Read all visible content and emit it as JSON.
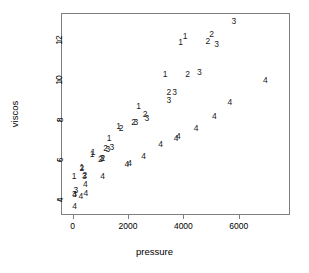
{
  "chart_data": {
    "type": "scatter",
    "title": "",
    "xlabel": "pressure",
    "ylabel": "viscos",
    "grid": false,
    "legend": "none",
    "point_style": "group-number-glyph",
    "xlim": [
      -420,
      7850
    ],
    "ylim": [
      3.25,
      13.35
    ],
    "xticks": [
      0,
      2000,
      4000,
      6000
    ],
    "yticks": [
      4,
      6,
      8,
      10,
      12
    ],
    "xtick_labels": [
      "0",
      "2000",
      "4000",
      "6000"
    ],
    "ytick_labels": [
      "4",
      "6",
      "8",
      "10",
      "12"
    ],
    "groups": [
      "1",
      "2",
      "3",
      "4"
    ],
    "points": [
      {
        "label": "1",
        "x": 55,
        "y": 5.22
      },
      {
        "label": "1",
        "x": 330,
        "y": 5.67
      },
      {
        "label": "1",
        "x": 700,
        "y": 6.32
      },
      {
        "label": "1",
        "x": 740,
        "y": 6.38
      },
      {
        "label": "1",
        "x": 1320,
        "y": 7.1
      },
      {
        "label": "1",
        "x": 1660,
        "y": 7.72
      },
      {
        "label": "1",
        "x": 2380,
        "y": 8.72
      },
      {
        "label": "1",
        "x": 3340,
        "y": 10.28
      },
      {
        "label": "1",
        "x": 3900,
        "y": 11.88
      },
      {
        "label": "1",
        "x": 4060,
        "y": 12.22
      },
      {
        "label": "2",
        "x": 330,
        "y": 5.62
      },
      {
        "label": "2",
        "x": 440,
        "y": 5.26
      },
      {
        "label": "2",
        "x": 1000,
        "y": 6.06
      },
      {
        "label": "2",
        "x": 1090,
        "y": 6.12
      },
      {
        "label": "2",
        "x": 1190,
        "y": 6.58
      },
      {
        "label": "2",
        "x": 1750,
        "y": 7.62
      },
      {
        "label": "2",
        "x": 2200,
        "y": 7.92
      },
      {
        "label": "2",
        "x": 2620,
        "y": 8.28
      },
      {
        "label": "2",
        "x": 3480,
        "y": 9.4
      },
      {
        "label": "2",
        "x": 4150,
        "y": 10.28
      },
      {
        "label": "2",
        "x": 4880,
        "y": 11.95
      },
      {
        "label": "2",
        "x": 5020,
        "y": 12.3
      },
      {
        "label": "3",
        "x": 120,
        "y": 4.52
      },
      {
        "label": "3",
        "x": 60,
        "y": 4.3
      },
      {
        "label": "3",
        "x": 420,
        "y": 5.22
      },
      {
        "label": "3",
        "x": 1060,
        "y": 6.08
      },
      {
        "label": "3",
        "x": 1270,
        "y": 6.56
      },
      {
        "label": "3",
        "x": 1420,
        "y": 6.66
      },
      {
        "label": "3",
        "x": 2280,
        "y": 7.92
      },
      {
        "label": "3",
        "x": 2680,
        "y": 8.12
      },
      {
        "label": "3",
        "x": 3480,
        "y": 9.02
      },
      {
        "label": "3",
        "x": 3680,
        "y": 9.4
      },
      {
        "label": "3",
        "x": 4580,
        "y": 10.38
      },
      {
        "label": "3",
        "x": 5200,
        "y": 11.82
      },
      {
        "label": "3",
        "x": 5820,
        "y": 12.95
      },
      {
        "label": "4",
        "x": 70,
        "y": 3.72
      },
      {
        "label": "4",
        "x": 70,
        "y": 4.28
      },
      {
        "label": "4",
        "x": 300,
        "y": 4.22
      },
      {
        "label": "4",
        "x": 480,
        "y": 4.36
      },
      {
        "label": "4",
        "x": 460,
        "y": 4.78
      },
      {
        "label": "4",
        "x": 1080,
        "y": 5.2
      },
      {
        "label": "4",
        "x": 1960,
        "y": 5.82
      },
      {
        "label": "4",
        "x": 2060,
        "y": 5.84
      },
      {
        "label": "4",
        "x": 2560,
        "y": 6.22
      },
      {
        "label": "4",
        "x": 3180,
        "y": 6.82
      },
      {
        "label": "4",
        "x": 3740,
        "y": 7.12
      },
      {
        "label": "4",
        "x": 3820,
        "y": 7.18
      },
      {
        "label": "4",
        "x": 4460,
        "y": 7.62
      },
      {
        "label": "4",
        "x": 5120,
        "y": 8.22
      },
      {
        "label": "4",
        "x": 5680,
        "y": 8.88
      },
      {
        "label": "4",
        "x": 6960,
        "y": 9.98
      }
    ]
  },
  "colors": {
    "frame": "#7f7f7f",
    "point": "#1a1a1a",
    "text": "#000000",
    "background": "#ffffff"
  }
}
